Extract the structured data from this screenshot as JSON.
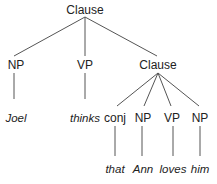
{
  "diagram": {
    "type": "syntax-tree",
    "root": {
      "label": "Clause"
    },
    "level1": [
      {
        "label": "NP",
        "leaf": "Joel"
      },
      {
        "label": "VP",
        "leaf": "thinks"
      },
      {
        "label": "Clause"
      }
    ],
    "level2": [
      {
        "label": "conj",
        "leaf": "that"
      },
      {
        "label": "NP",
        "leaf": "Ann"
      },
      {
        "label": "VP",
        "leaf": "loves"
      },
      {
        "label": "NP",
        "leaf": "him"
      }
    ],
    "colors": {
      "text": "#222222",
      "edge": "#555555",
      "background": "#ffffff"
    }
  }
}
